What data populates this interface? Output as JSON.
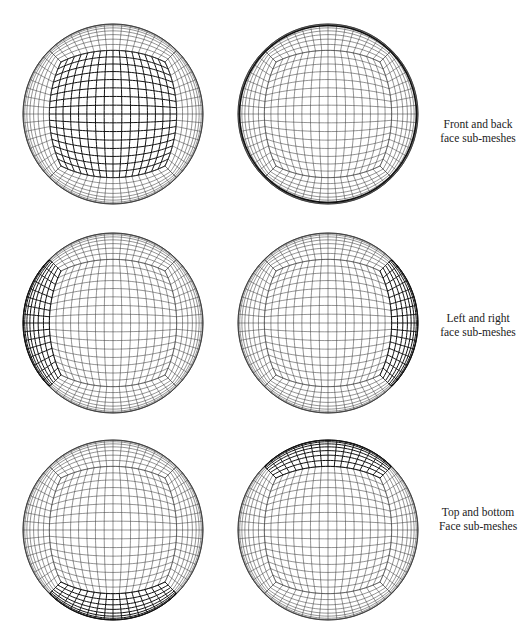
{
  "figure": {
    "rows": [
      {
        "caption": [
          "Front and back",
          "face sub-meshes"
        ],
        "panels": [
          {
            "highlight": "front",
            "label": "front-face-sub-mesh"
          },
          {
            "highlight": "back",
            "label": "back-face-sub-mesh"
          }
        ]
      },
      {
        "caption": [
          "Left and right",
          "face sub-meshes"
        ],
        "panels": [
          {
            "highlight": "left",
            "label": "left-face-sub-mesh"
          },
          {
            "highlight": "right",
            "label": "right-face-sub-mesh"
          }
        ]
      },
      {
        "caption": [
          "Top and bottom",
          "Face sub-meshes"
        ],
        "panels": [
          {
            "highlight": "bottom",
            "label": "bottom-face-sub-mesh"
          },
          {
            "highlight": "top",
            "label": "top-face-sub-mesh"
          }
        ]
      }
    ],
    "mesh": {
      "n": 16,
      "radius": 90,
      "line_color": "#3a3a3a",
      "highlight_color": "#111111",
      "centers": [
        [
          113,
          114
        ],
        [
          328,
          114
        ],
        [
          113,
          323
        ],
        [
          328,
          323
        ],
        [
          113,
          530
        ],
        [
          328,
          530
        ]
      ]
    }
  }
}
